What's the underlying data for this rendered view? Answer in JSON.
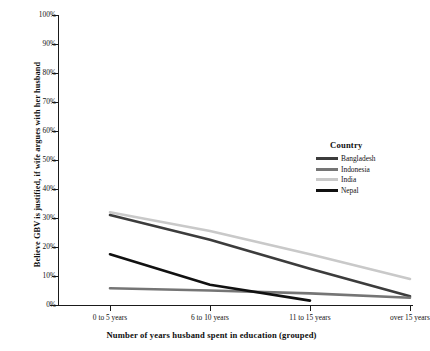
{
  "chart_data": {
    "type": "line",
    "title": "",
    "xlabel": "Number of years husband spent in education (grouped)",
    "ylabel": "Believe GBV is justified, if wife argues with her husband",
    "categories": [
      "0 to 5 years",
      "6 to 10 years",
      "11 to 15 years",
      "over 15 years"
    ],
    "ylim": [
      0,
      100
    ],
    "ytick_labels": [
      "0%",
      "10%",
      "20%",
      "30%",
      "40%",
      "50%",
      "60%",
      "70%",
      "80%",
      "90%",
      "100%"
    ],
    "ytick_values": [
      0,
      10,
      20,
      30,
      40,
      50,
      60,
      70,
      80,
      90,
      100
    ],
    "grid": false,
    "legend_position": "right-inside",
    "legend_title": "Country",
    "units": "percent",
    "series": [
      {
        "name": "Bangladesh",
        "color": "#3c3c3c",
        "values": [
          31.0,
          22.5,
          12.5,
          3.0
        ]
      },
      {
        "name": "Indonesia",
        "color": "#757575",
        "values": [
          5.8,
          5.0,
          4.0,
          2.5
        ]
      },
      {
        "name": "India",
        "color": "#c9c9c9",
        "values": [
          32.0,
          25.5,
          17.5,
          9.0
        ]
      },
      {
        "name": "Nepal",
        "color": "#111111",
        "values": [
          17.5,
          7.0,
          1.5,
          null
        ]
      }
    ]
  },
  "axis": {
    "x_title": "Number of years husband spent in education (grouped)",
    "y_title": "Believe GBV is justified, if wife argues with her husband"
  },
  "legend": {
    "title": "Country",
    "items": [
      {
        "label": "Bangladesh",
        "color": "#3c3c3c"
      },
      {
        "label": "Indonesia",
        "color": "#757575"
      },
      {
        "label": "India",
        "color": "#c9c9c9"
      },
      {
        "label": "Nepal",
        "color": "#111111"
      }
    ]
  }
}
